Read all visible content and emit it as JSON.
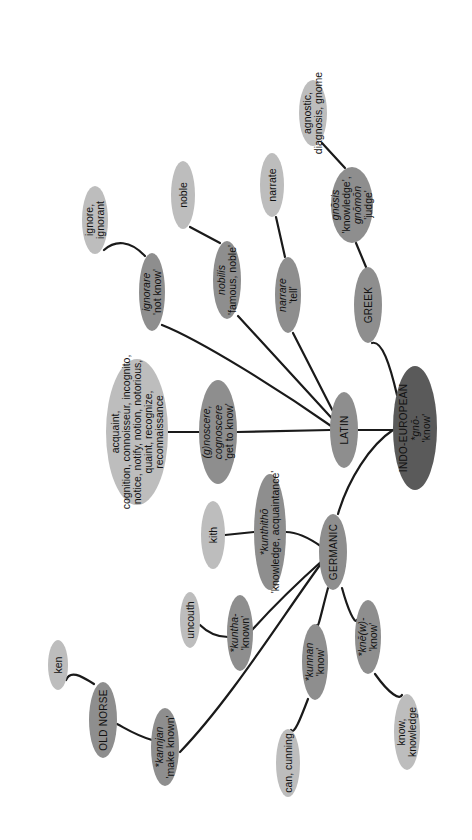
{
  "diagram": {
    "type": "etymology-tree",
    "orientation": "rotated-90-clockwise",
    "colors": {
      "root": "#5a5a5a",
      "branch": "#8e8e8e",
      "derived": "#bdbdbd",
      "edge": "#1a1a1a",
      "background": "#ffffff"
    },
    "nodes": [
      {
        "id": "indo-european",
        "kind": "root",
        "lines": [
          {
            "t": "INDO-EUROPEAN"
          },
          {
            "t": "*gnō-",
            "i": true
          },
          {
            "t": "'know'"
          }
        ]
      },
      {
        "id": "latin",
        "kind": "branch",
        "lines": [
          {
            "t": "LATIN"
          }
        ]
      },
      {
        "id": "greek",
        "kind": "branch",
        "lines": [
          {
            "t": "GREEK"
          }
        ]
      },
      {
        "id": "germanic",
        "kind": "branch",
        "lines": [
          {
            "t": "GERMANIC"
          }
        ]
      },
      {
        "id": "old-norse",
        "kind": "branch",
        "lines": [
          {
            "t": "OLD NORSE"
          }
        ]
      },
      {
        "id": "gnosis",
        "kind": "branch",
        "lines": [
          {
            "t": "gnōsis",
            "i": true
          },
          {
            "t": "'knowledge',"
          },
          {
            "t": "gnōmōn",
            "i": true
          },
          {
            "t": "'judge'"
          }
        ]
      },
      {
        "id": "agnostic",
        "kind": "derived",
        "lines": [
          {
            "t": "agnostic,"
          },
          {
            "t": "diagnosis, gnome"
          }
        ]
      },
      {
        "id": "narrare",
        "kind": "branch",
        "lines": [
          {
            "t": "narrare",
            "i": true
          },
          {
            "t": "'tell'"
          }
        ]
      },
      {
        "id": "narrate",
        "kind": "derived",
        "lines": [
          {
            "t": "narrate"
          }
        ]
      },
      {
        "id": "nobilis",
        "kind": "branch",
        "lines": [
          {
            "t": "nobilis",
            "i": true
          },
          {
            "t": "'famous, noble'"
          }
        ]
      },
      {
        "id": "noble",
        "kind": "derived",
        "lines": [
          {
            "t": "noble"
          }
        ]
      },
      {
        "id": "ignorare",
        "kind": "branch",
        "lines": [
          {
            "t": "ignorare",
            "i": true
          },
          {
            "t": "'not know'"
          }
        ]
      },
      {
        "id": "ignore",
        "kind": "derived",
        "lines": [
          {
            "t": "ignore,"
          },
          {
            "t": "ignorant"
          }
        ]
      },
      {
        "id": "gnoscere",
        "kind": "branch",
        "lines": [
          {
            "t": "(g)noscere,",
            "i": true
          },
          {
            "t": "cognoscere",
            "i": true
          },
          {
            "t": "'get to know'"
          }
        ]
      },
      {
        "id": "acquaint",
        "kind": "derived",
        "lines": [
          {
            "t": "acquaint,"
          },
          {
            "t": "cognition, connoisseur, incognito,"
          },
          {
            "t": "notice, notify, notion, notorious,"
          },
          {
            "t": "quaint, recognize,"
          },
          {
            "t": "reconnaissance"
          }
        ]
      },
      {
        "id": "kunthitho",
        "kind": "branch",
        "lines": [
          {
            "t": "*kunthithō",
            "i": true
          },
          {
            "t": "'knowledge, acquaintance'"
          }
        ]
      },
      {
        "id": "kith",
        "kind": "derived",
        "lines": [
          {
            "t": "kith"
          }
        ]
      },
      {
        "id": "kuntha",
        "kind": "branch",
        "lines": [
          {
            "t": "*kuntha-",
            "i": true
          },
          {
            "t": "'known'"
          }
        ]
      },
      {
        "id": "uncouth",
        "kind": "derived",
        "lines": [
          {
            "t": "uncouth"
          }
        ]
      },
      {
        "id": "kunnan",
        "kind": "branch",
        "lines": [
          {
            "t": "*kunnan",
            "i": true
          },
          {
            "t": "'know'"
          }
        ]
      },
      {
        "id": "can-cunning",
        "kind": "derived",
        "lines": [
          {
            "t": "can, cunning"
          }
        ]
      },
      {
        "id": "knew",
        "kind": "branch",
        "lines": [
          {
            "t": "*knē(w)-",
            "i": true
          },
          {
            "t": "'know'"
          }
        ]
      },
      {
        "id": "know-knowledge",
        "kind": "derived",
        "lines": [
          {
            "t": "know,"
          },
          {
            "t": "knowledge"
          }
        ]
      },
      {
        "id": "kannjan",
        "kind": "branch",
        "lines": [
          {
            "t": "*kannjan",
            "i": true
          },
          {
            "t": "'make known'"
          }
        ]
      },
      {
        "id": "ken",
        "kind": "derived",
        "lines": [
          {
            "t": "ken"
          }
        ]
      }
    ],
    "edges": [
      [
        "indo-european",
        "latin"
      ],
      [
        "indo-european",
        "greek"
      ],
      [
        "indo-european",
        "germanic"
      ],
      [
        "greek",
        "gnosis"
      ],
      [
        "gnosis",
        "agnostic"
      ],
      [
        "latin",
        "narrare"
      ],
      [
        "narrare",
        "narrate"
      ],
      [
        "latin",
        "nobilis"
      ],
      [
        "nobilis",
        "noble"
      ],
      [
        "latin",
        "ignorare"
      ],
      [
        "ignorare",
        "ignore"
      ],
      [
        "latin",
        "gnoscere"
      ],
      [
        "gnoscere",
        "acquaint"
      ],
      [
        "germanic",
        "kunthitho"
      ],
      [
        "kunthitho",
        "kith"
      ],
      [
        "germanic",
        "kuntha"
      ],
      [
        "kuntha",
        "uncouth"
      ],
      [
        "germanic",
        "kunnan"
      ],
      [
        "kunnan",
        "can-cunning"
      ],
      [
        "germanic",
        "knew"
      ],
      [
        "knew",
        "know-knowledge"
      ],
      [
        "germanic",
        "kannjan"
      ],
      [
        "kannjan",
        "old-norse"
      ],
      [
        "old-norse",
        "ken"
      ]
    ]
  }
}
